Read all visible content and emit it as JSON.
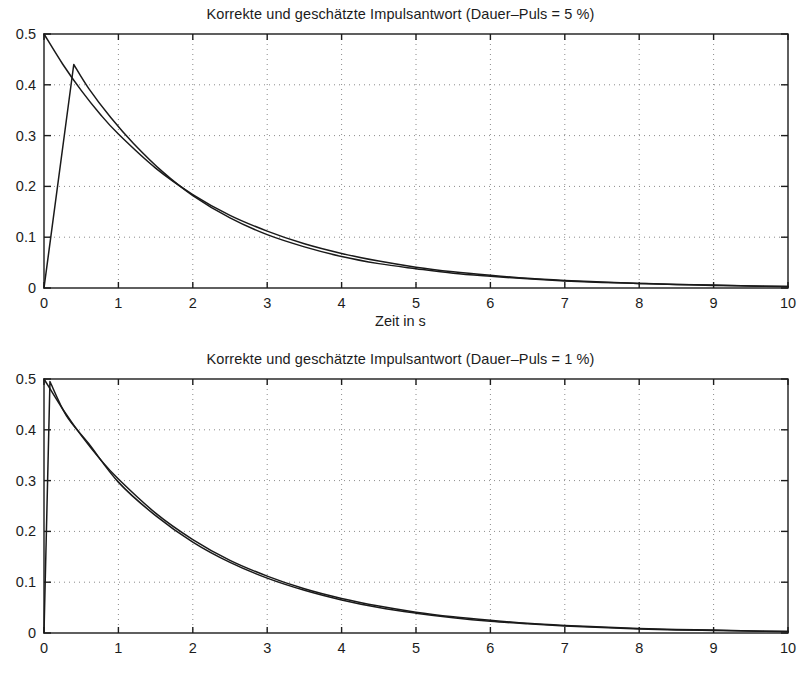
{
  "figure": {
    "background": "#ffffff",
    "axis_color": "#1c1c1c",
    "grid_color": "#8a8a8a",
    "curve_true_color": "#1a1a1a",
    "curve_est_color": "#1a1a1a",
    "width": 801,
    "height": 691
  },
  "panels": [
    {
      "id": "top",
      "title": "Korrekte und geschätzte Impulsantwort (Dauer–Puls = 5 %)",
      "xlabel": "Zeit in s",
      "ylabel": ""
    },
    {
      "id": "bottom",
      "title": "Korrekte und geschätzte Impulsantwort (Dauer–Puls = 1 %)",
      "xlabel": "Zeit in s",
      "ylabel": ""
    }
  ],
  "chart_data": [
    {
      "type": "line",
      "title": "Korrekte und geschätzte Impulsantwort (Dauer–Puls = 5 %)",
      "xlabel": "Zeit in s",
      "ylabel": "",
      "xlim": [
        0,
        10
      ],
      "ylim": [
        0,
        0.5
      ],
      "xticks": [
        0,
        1,
        2,
        3,
        4,
        5,
        6,
        7,
        8,
        9,
        10
      ],
      "xticklabels": [
        "0",
        "1",
        "2",
        "3",
        "4",
        "5",
        "6",
        "7",
        "8",
        "9",
        "10"
      ],
      "yticks": [
        0,
        0.1,
        0.2,
        0.3,
        0.4,
        0.5
      ],
      "yticklabels": [
        "0",
        "0.1",
        "0.2",
        "0.3",
        "0.4",
        "0.5"
      ],
      "grid": true,
      "grid_style": "dotted",
      "legend": null,
      "series": [
        {
          "name": "Korrekte Impulsantwort",
          "comment": "true impulse response h(t)=0.5*exp(-0.5*t)",
          "x": [
            0,
            0.25,
            0.5,
            0.75,
            1,
            1.5,
            2,
            2.5,
            3,
            3.5,
            4,
            4.5,
            5,
            5.5,
            6,
            6.5,
            7,
            7.5,
            8,
            8.5,
            9,
            9.5,
            10
          ],
          "values": [
            0.5,
            0.441,
            0.389,
            0.343,
            0.303,
            0.236,
            0.184,
            0.143,
            0.112,
            0.087,
            0.068,
            0.053,
            0.041,
            0.032,
            0.025,
            0.019,
            0.015,
            0.012,
            0.009,
            0.007,
            0.006,
            0.004,
            0.003
          ]
        },
        {
          "name": "Geschätzte Impulsantwort",
          "comment": "estimate rises linearly 0 -> 0.44 over first 0.4 s then decays",
          "x": [
            0,
            0.4,
            0.6,
            0.9,
            1.2,
            1.6,
            2,
            2.5,
            3,
            3.5,
            4,
            4.5,
            5,
            5.5,
            6,
            6.5,
            7,
            7.5,
            8,
            8.5,
            9,
            9.5,
            10
          ],
          "values": [
            0.0,
            0.44,
            0.393,
            0.335,
            0.285,
            0.228,
            0.182,
            0.138,
            0.105,
            0.081,
            0.062,
            0.048,
            0.038,
            0.029,
            0.023,
            0.018,
            0.014,
            0.011,
            0.009,
            0.007,
            0.005,
            0.004,
            0.003
          ]
        }
      ]
    },
    {
      "type": "line",
      "title": "Korrekte und geschätzte Impulsantwort (Dauer–Puls = 1 %)",
      "xlabel": "Zeit in s",
      "ylabel": "",
      "xlim": [
        0,
        10
      ],
      "ylim": [
        0,
        0.5
      ],
      "xticks": [
        0,
        1,
        2,
        3,
        4,
        5,
        6,
        7,
        8,
        9,
        10
      ],
      "xticklabels": [
        "0",
        "1",
        "2",
        "3",
        "4",
        "5",
        "6",
        "7",
        "8",
        "9",
        "10"
      ],
      "yticks": [
        0,
        0.1,
        0.2,
        0.3,
        0.4,
        0.5
      ],
      "yticklabels": [
        "0",
        "0.1",
        "0.2",
        "0.3",
        "0.4",
        "0.5"
      ],
      "grid": true,
      "grid_style": "dotted",
      "legend": null,
      "series": [
        {
          "name": "Korrekte Impulsantwort",
          "comment": "true impulse response h(t)=0.5*exp(-0.5*t)",
          "x": [
            0,
            0.25,
            0.5,
            0.75,
            1,
            1.5,
            2,
            2.5,
            3,
            3.5,
            4,
            4.5,
            5,
            5.5,
            6,
            6.5,
            7,
            7.5,
            8,
            8.5,
            9,
            9.5,
            10
          ],
          "values": [
            0.5,
            0.441,
            0.389,
            0.343,
            0.303,
            0.236,
            0.184,
            0.143,
            0.112,
            0.087,
            0.068,
            0.053,
            0.041,
            0.032,
            0.025,
            0.019,
            0.015,
            0.012,
            0.009,
            0.007,
            0.006,
            0.004,
            0.003
          ]
        },
        {
          "name": "Geschätzte Impulsantwort",
          "comment": "estimate rises almost vertically to 0.495 at t=0.08 then tracks true curve closely",
          "x": [
            0,
            0.08,
            0.3,
            0.6,
            1,
            1.5,
            2,
            2.5,
            3,
            3.5,
            4,
            4.5,
            5,
            5.5,
            6,
            6.5,
            7,
            7.5,
            8,
            8.5,
            9,
            9.5,
            10
          ],
          "values": [
            0.0,
            0.495,
            0.428,
            0.373,
            0.297,
            0.231,
            0.179,
            0.139,
            0.108,
            0.084,
            0.065,
            0.05,
            0.039,
            0.03,
            0.023,
            0.018,
            0.014,
            0.011,
            0.008,
            0.006,
            0.005,
            0.004,
            0.003
          ]
        }
      ]
    }
  ]
}
